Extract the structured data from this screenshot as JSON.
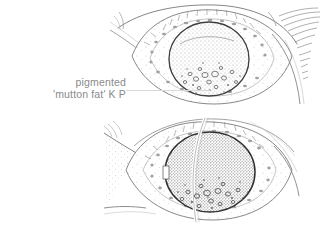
{
  "figure": {
    "title": "pigmented 'mutton fat' K P",
    "background_color": "#ffffff",
    "ink_color": "#4a4a4a",
    "label_color": "#8a8a8a",
    "leader_color": "#d8d8d8",
    "width": 327,
    "height": 236
  },
  "annotation": {
    "line1": "pigmented",
    "line2": "'mutton fat' K P"
  },
  "panels": [
    {
      "name": "upper-eye-view",
      "description": "anterior segment of eye, cornea stippled light gray with inferior cluster of ring-shaped keratic precipitates",
      "iris_tone": "#b9b9b9"
    },
    {
      "name": "lower-eye-view",
      "description": "anterior segment of eye with darker stippled cornea, slit lamp beam crossing vertically and inferior cluster of keratic precipitates",
      "iris_tone": "#8f8f8f"
    }
  ]
}
